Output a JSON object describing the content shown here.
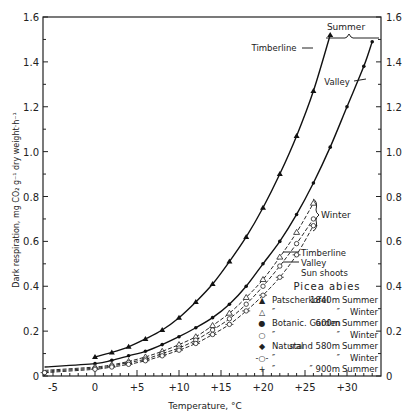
{
  "chart_data": {
    "type": "line",
    "title": "",
    "xlabel": "Temperature, °C",
    "ylabel": "Dark respiration, mg CO2 g-1 dry weight·h-1",
    "xlim": [
      -6,
      33
    ],
    "ylim": [
      0,
      1.6
    ],
    "x_ticks": [
      "-5",
      "0",
      "+5",
      "+10",
      "+15",
      "+20",
      "+25",
      "+30"
    ],
    "x_tick_values": [
      -5,
      0,
      5,
      10,
      15,
      20,
      25,
      30
    ],
    "y_ticks_left": [
      "0",
      "0.2",
      "0.4",
      "0.6",
      "0.8",
      "1.0",
      "1.2",
      "1.4",
      "1.6"
    ],
    "y_ticks_right": [
      "0",
      "0.2",
      "0.4",
      "0.6",
      "0.8",
      "1.0",
      "1.2",
      "1.4",
      "1.6"
    ],
    "y_tick_values": [
      0,
      0.2,
      0.4,
      0.6,
      0.8,
      1.0,
      1.2,
      1.4,
      1.6
    ],
    "grid": false,
    "legend_title": "Picea abies",
    "legend": [
      {
        "marker": "▲",
        "site": "Patscherkofel 1840m",
        "season": "Summer"
      },
      {
        "marker": "△",
        "site": "″        ″",
        "season": "Winter"
      },
      {
        "marker": "●",
        "site": "Botanic. Garden 600m",
        "season": "Summer"
      },
      {
        "marker": "○",
        "site": "″        ″",
        "season": "Winter"
      },
      {
        "marker": "◆",
        "site": "Natural stand 580m",
        "season": "Summer"
      },
      {
        "marker": "-○-",
        "site": "″        ″",
        "season": "Winter"
      },
      {
        "marker": "+",
        "site": "″  900m",
        "season": "Summer"
      }
    ],
    "annotations": [
      {
        "text": "Summer",
        "position": "top right, brace between curve ends"
      },
      {
        "text": "Timberline",
        "target": "summer timberline curve"
      },
      {
        "text": "Valley",
        "target": "summer valley curve"
      },
      {
        "text": "Winter",
        "target": "winter curve cluster, brace"
      },
      {
        "text": "Timberline",
        "target": "winter timberline curve"
      },
      {
        "text": "Valley",
        "target": "winter valley curve"
      },
      {
        "text": "Sun shoots",
        "target": "winter group"
      }
    ],
    "series": [
      {
        "name": "Timberline Summer (Patscherkofel 1840m)",
        "marker": "filled-triangle",
        "line": "solid",
        "x": [
          0,
          2,
          4,
          6,
          8,
          10,
          12,
          14,
          16,
          18,
          20,
          22,
          24,
          26,
          28
        ],
        "y": [
          0.085,
          0.105,
          0.13,
          0.165,
          0.205,
          0.26,
          0.33,
          0.41,
          0.51,
          0.62,
          0.75,
          0.9,
          1.07,
          1.27,
          1.52
        ]
      },
      {
        "name": "Valley Summer (Botanic Garden 600m / Natural stand 580m)",
        "marker": "filled-circle",
        "line": "solid",
        "x": [
          -6,
          0,
          2,
          4,
          6,
          8,
          10,
          12,
          14,
          16,
          18,
          20,
          22,
          24,
          26,
          28,
          30,
          32,
          33
        ],
        "y": [
          0.04,
          0.055,
          0.07,
          0.09,
          0.11,
          0.14,
          0.175,
          0.215,
          0.26,
          0.32,
          0.4,
          0.5,
          0.6,
          0.72,
          0.86,
          1.02,
          1.2,
          1.38,
          1.49
        ]
      },
      {
        "name": "Winter Timberline",
        "marker": "open-triangle",
        "line": "dashed",
        "x": [
          -6,
          0,
          2,
          4,
          6,
          8,
          10,
          12,
          14,
          16,
          18,
          20,
          22,
          24,
          26
        ],
        "y": [
          0.025,
          0.04,
          0.05,
          0.065,
          0.085,
          0.11,
          0.14,
          0.175,
          0.225,
          0.28,
          0.35,
          0.43,
          0.53,
          0.64,
          0.77
        ]
      },
      {
        "name": "Winter Valley",
        "marker": "open-circle",
        "line": "dashed",
        "x": [
          -6,
          0,
          2,
          4,
          6,
          8,
          10,
          12,
          14,
          16,
          18,
          20,
          22,
          24,
          26
        ],
        "y": [
          0.02,
          0.035,
          0.045,
          0.06,
          0.075,
          0.1,
          0.125,
          0.16,
          0.205,
          0.255,
          0.32,
          0.4,
          0.49,
          0.59,
          0.7
        ]
      },
      {
        "name": "Winter Sun shoots",
        "marker": "circle-dash",
        "line": "dashed",
        "x": [
          -6,
          0,
          2,
          4,
          6,
          8,
          10,
          12,
          14,
          16,
          18,
          20,
          22,
          24,
          26
        ],
        "y": [
          0.015,
          0.03,
          0.04,
          0.052,
          0.068,
          0.09,
          0.115,
          0.145,
          0.185,
          0.23,
          0.29,
          0.36,
          0.44,
          0.54,
          0.67
        ]
      }
    ]
  },
  "labels": {
    "summer": "Summer",
    "winter": "Winter",
    "timberline": "Timberline",
    "valley": "Valley",
    "w_timberline": "Timberline",
    "w_valley": "Valley",
    "sun_shoots": "Sun shoots",
    "legend_title": "Picea abies",
    "legend_rows": [
      {
        "m": "▲",
        "a": "Patscherkofel",
        "b": "1840m",
        "c": "Summer"
      },
      {
        "m": "△",
        "a": "″",
        "b": "″",
        "c": "Winter"
      },
      {
        "m": "●",
        "a": "Botanic. Garden",
        "b": "600m",
        "c": "Summer"
      },
      {
        "m": "○",
        "a": "″",
        "b": "″",
        "c": "Winter"
      },
      {
        "m": "◆",
        "a": "Natural",
        "b": "stand 580m",
        "c": "Summer"
      },
      {
        "m": "-○-",
        "a": "″",
        "b": "″",
        "c": "Winter"
      },
      {
        "m": "+",
        "a": "″",
        "b": "″ 900m",
        "c": "Summer"
      }
    ],
    "xlabel": "Temperature, °C",
    "ylabel": "Dark respiration, mg CO₂ g⁻¹ dry weight·h⁻¹"
  }
}
